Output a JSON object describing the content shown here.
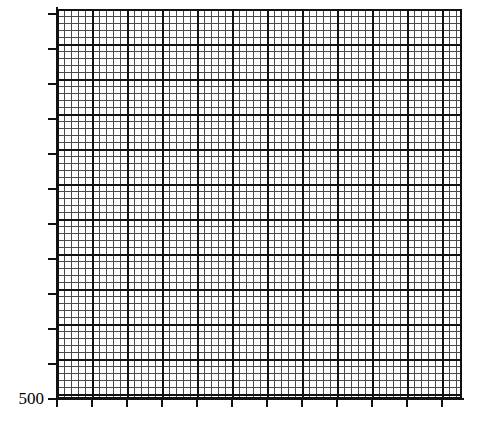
{
  "figure": {
    "width": 483,
    "height": 422,
    "background_color": "#ffffff"
  },
  "chart_data": {
    "type": "line",
    "title": "",
    "subtitle": "",
    "xlabel": "",
    "ylabel": "",
    "series": [],
    "categories": [],
    "values": [],
    "annotations": [],
    "legend": {
      "entries": [],
      "position": "none",
      "visible": false
    },
    "grid": {
      "visible": true,
      "style": "graph-paper",
      "minor_spacing_px": 7,
      "major_spacing_px": 35,
      "minor_per_major": 5,
      "major_columns": 11,
      "major_rows": 11,
      "minor_color": "#4a4a4a",
      "major_color": "#111111"
    },
    "x_axis": {
      "tick_labels": [],
      "tick_count": 12,
      "ticks_visible": true,
      "range_px": [
        57,
        462
      ]
    },
    "y_axis": {
      "tick_labels": [
        "500"
      ],
      "labeled_tick_index": 0,
      "tick_count": 12,
      "ticks_visible": true,
      "range_px": [
        9,
        399
      ]
    },
    "note": "Blank graph-paper plot: fine grid with no plotted data series; only the bottom y-axis tick is labeled."
  },
  "axes": {
    "y_ticks": [
      {
        "label": "500",
        "position_px": 399,
        "labeled": true
      },
      {
        "label": "",
        "position_px": 364,
        "labeled": false
      },
      {
        "label": "",
        "position_px": 329,
        "labeled": false
      },
      {
        "label": "",
        "position_px": 294,
        "labeled": false
      },
      {
        "label": "",
        "position_px": 259,
        "labeled": false
      },
      {
        "label": "",
        "position_px": 224,
        "labeled": false
      },
      {
        "label": "",
        "position_px": 189,
        "labeled": false
      },
      {
        "label": "",
        "position_px": 154,
        "labeled": false
      },
      {
        "label": "",
        "position_px": 119,
        "labeled": false
      },
      {
        "label": "",
        "position_px": 84,
        "labeled": false
      },
      {
        "label": "",
        "position_px": 49,
        "labeled": false
      },
      {
        "label": "",
        "position_px": 14,
        "labeled": false
      }
    ],
    "x_ticks": [
      {
        "label": "",
        "position_px": 57
      },
      {
        "label": "",
        "position_px": 92
      },
      {
        "label": "",
        "position_px": 127
      },
      {
        "label": "",
        "position_px": 162
      },
      {
        "label": "",
        "position_px": 197
      },
      {
        "label": "",
        "position_px": 232
      },
      {
        "label": "",
        "position_px": 267
      },
      {
        "label": "",
        "position_px": 302
      },
      {
        "label": "",
        "position_px": 337
      },
      {
        "label": "",
        "position_px": 372
      },
      {
        "label": "",
        "position_px": 407
      },
      {
        "label": "",
        "position_px": 442
      }
    ],
    "axis_color": "#111111",
    "label_color": "#000000"
  },
  "labels": {
    "y_500": "500"
  }
}
